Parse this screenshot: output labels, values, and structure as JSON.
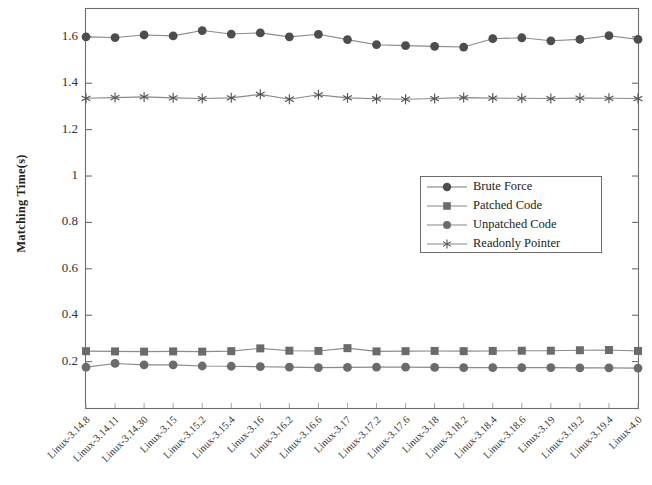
{
  "chart_data": {
    "type": "line",
    "title": "",
    "xlabel": "",
    "ylabel": "Matching Time(s)",
    "ylim": [
      0,
      1.72
    ],
    "yticks": [
      0.2,
      0.4,
      0.6,
      0.8,
      1,
      1.2,
      1.4,
      1.6
    ],
    "ytick_labels": [
      "0.2",
      "0.4",
      "0.6",
      "0.8",
      "1",
      "1.2",
      "1.4",
      "1.6"
    ],
    "grid": false,
    "legend_position": "center-right",
    "categories": [
      "Linux-3.14.8",
      "Linux-3.14.11",
      "Linux-3.14.30",
      "Linux-3.15",
      "Linux-3.15.2",
      "Linux-3.15.4",
      "Linux-3.16",
      "Linux-3.16.2",
      "Linux-3.16.6",
      "Linux-3.17",
      "Linux-3.17.2",
      "Linux-3.17.6",
      "Linux-3.18",
      "Linux-3.18.2",
      "Linux-3.18.4",
      "Linux-3.18.6",
      "Linux-3.19",
      "Linux-3.19.2",
      "Linux-3.19.4",
      "Linux-4.0"
    ],
    "series": [
      {
        "name": "Brute Force",
        "marker": "circle-filled",
        "color": "#4d4d4d",
        "values": [
          1.6,
          1.597,
          1.608,
          1.604,
          1.627,
          1.612,
          1.617,
          1.6,
          1.611,
          1.588,
          1.566,
          1.562,
          1.559,
          1.556,
          1.592,
          1.596,
          1.583,
          1.589,
          1.605,
          1.589
        ]
      },
      {
        "name": "Patched Code",
        "marker": "square-filled",
        "color": "#6b6b6b",
        "values": [
          0.245,
          0.244,
          0.243,
          0.244,
          0.243,
          0.245,
          0.257,
          0.247,
          0.246,
          0.258,
          0.244,
          0.245,
          0.246,
          0.245,
          0.246,
          0.247,
          0.247,
          0.249,
          0.25,
          0.246
        ]
      },
      {
        "name": "Unpatched Code",
        "marker": "circle-filled",
        "color": "#6b6b6b",
        "values": [
          0.176,
          0.192,
          0.186,
          0.186,
          0.181,
          0.18,
          0.178,
          0.176,
          0.174,
          0.175,
          0.176,
          0.176,
          0.175,
          0.174,
          0.174,
          0.174,
          0.174,
          0.173,
          0.173,
          0.172
        ]
      },
      {
        "name": "Readonly Pointer",
        "marker": "star",
        "color": "#555555",
        "values": [
          1.335,
          1.338,
          1.341,
          1.337,
          1.334,
          1.337,
          1.352,
          1.331,
          1.35,
          1.337,
          1.333,
          1.331,
          1.334,
          1.338,
          1.336,
          1.335,
          1.334,
          1.336,
          1.335,
          1.334
        ]
      }
    ]
  },
  "legend": {
    "items": [
      {
        "label": "Brute Force"
      },
      {
        "label": "Patched Code"
      },
      {
        "label": "Unpatched Code"
      },
      {
        "label": "Readonly Pointer"
      }
    ]
  },
  "axes": {
    "y_label": "Matching Time(s)"
  }
}
